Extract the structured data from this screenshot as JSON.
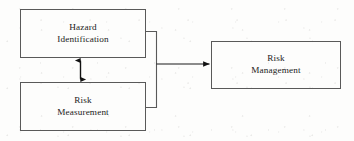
{
  "diagram": {
    "background_color": "#fdfdfc",
    "line_color": "#595959",
    "text_color": "#1b1b1b",
    "nodes": [
      {
        "id": "hazard-identification",
        "line1": "Hazard",
        "line2": "Identification",
        "x": 20,
        "y": 9,
        "width": 126,
        "height": 49
      },
      {
        "id": "risk-measurement",
        "line1": "Risk",
        "line2": "Measurement",
        "x": 20,
        "y": 82,
        "width": 126,
        "height": 49
      },
      {
        "id": "risk-management",
        "line1": "Risk",
        "line2": "Management",
        "x": 211,
        "y": 41,
        "width": 130,
        "height": 48
      }
    ],
    "connectors": [
      {
        "id": "bidirectional-vertical-arrow",
        "from": "hazard-identification",
        "to": "risk-measurement",
        "style": "double-headed",
        "orientation": "vertical"
      },
      {
        "id": "merge-bracket-arrow",
        "from": "hazard-identification, risk-measurement",
        "to": "risk-management",
        "style": "single-headed",
        "orientation": "horizontal"
      }
    ]
  }
}
